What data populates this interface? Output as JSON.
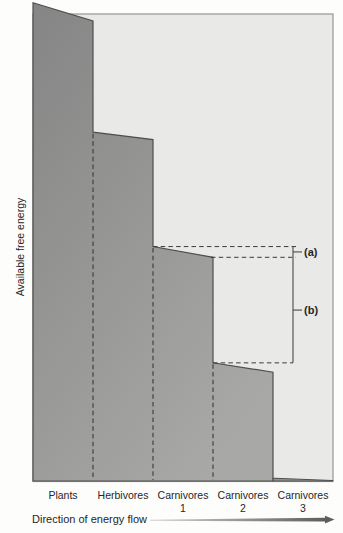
{
  "figure": {
    "y_axis_label": "Available free energy",
    "x_axis_caption": "Direction of energy flow",
    "annotation_a": "(a)",
    "annotation_b": "(b)"
  },
  "chart_data": {
    "type": "area",
    "title": "",
    "xlabel": "Direction of energy flow",
    "ylabel": "Available free energy",
    "categories": [
      "Plants",
      "Herbivores",
      "Carnivores 1",
      "Carnivores 2",
      "Carnivores 3"
    ],
    "category_line1": [
      "Plants",
      "Herbivores",
      "Carnivores",
      "Carnivores",
      "Carnivores"
    ],
    "category_line2": [
      "",
      "",
      "1",
      "2",
      "3"
    ],
    "series": [
      {
        "name": "Available free energy",
        "values_pct_at_left_edge": [
          102.4,
          74.7,
          50.2,
          25.3,
          0.6
        ],
        "values_pct_at_right_edge": [
          98.5,
          73.1,
          47.9,
          23.3,
          0.1
        ]
      }
    ],
    "ylim": [
      0,
      100
    ],
    "axis_ticks": "none",
    "grid": false,
    "legend": "none",
    "annotations": [
      {
        "label": "(a)",
        "from_pct": 50.2,
        "to_pct": 47.9
      },
      {
        "label": "(b)",
        "from_pct": 47.9,
        "to_pct": 25.3
      }
    ]
  },
  "colors": {
    "page_bg": "#fdfdfc",
    "plot_bg": "#e9e9e7",
    "bar_fill_dark": "#858585",
    "bar_fill_light": "#a8a8a6",
    "bar_outline": "#4f4f4f",
    "frame": "#979795",
    "dashed_line": "#3a3a3a",
    "bracket": "#4a4a4a",
    "text": "#262626",
    "arrow_start": "#d2d2d0",
    "arrow_end": "#5e5e5c"
  }
}
